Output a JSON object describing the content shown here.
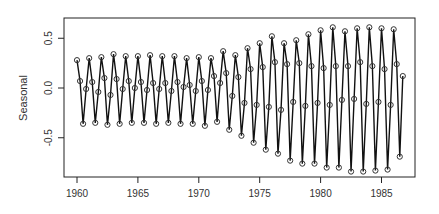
{
  "chart_data": {
    "type": "line",
    "title": "",
    "xlabel": "",
    "ylabel": "Seasonal",
    "xlim": [
      1958.9,
      1987.8
    ],
    "ylim": [
      -0.9,
      0.7
    ],
    "x_ticks": [
      1960,
      1965,
      1970,
      1975,
      1980,
      1985
    ],
    "x_tick_labels": [
      "1960",
      "1965",
      "1970",
      "1975",
      "1980",
      "1985"
    ],
    "y_ticks": [
      -0.5,
      0.0,
      0.5
    ],
    "y_tick_labels": [
      "-0.5",
      "0.0",
      "0.5"
    ],
    "grid": false,
    "legend": null,
    "frequency": 4,
    "start": 1960.0,
    "markers": "open-circle-with-line",
    "series": [
      {
        "name": "Seasonal",
        "values": [
          0.28,
          0.07,
          -0.36,
          -0.01,
          0.3,
          0.06,
          -0.35,
          -0.04,
          0.31,
          0.1,
          -0.37,
          -0.07,
          0.34,
          0.09,
          -0.36,
          -0.01,
          0.32,
          0.07,
          -0.35,
          0.0,
          0.32,
          0.06,
          -0.35,
          -0.02,
          0.33,
          0.05,
          -0.36,
          -0.01,
          0.32,
          0.05,
          -0.35,
          -0.03,
          0.32,
          0.06,
          -0.36,
          0.01,
          0.3,
          0.03,
          -0.36,
          -0.03,
          0.31,
          0.07,
          -0.38,
          -0.02,
          0.3,
          0.12,
          -0.34,
          0.05,
          0.37,
          0.15,
          -0.42,
          -0.08,
          0.33,
          0.11,
          -0.48,
          -0.15,
          0.4,
          0.19,
          -0.55,
          -0.17,
          0.45,
          0.21,
          -0.62,
          -0.19,
          0.52,
          0.26,
          -0.66,
          -0.22,
          0.45,
          0.24,
          -0.73,
          -0.14,
          0.48,
          0.25,
          -0.76,
          -0.18,
          0.54,
          0.22,
          -0.76,
          -0.15,
          0.58,
          0.2,
          -0.8,
          -0.17,
          0.61,
          0.22,
          -0.8,
          -0.12,
          0.57,
          0.22,
          -0.84,
          -0.11,
          0.6,
          0.26,
          -0.84,
          -0.16,
          0.61,
          0.22,
          -0.83,
          -0.14,
          0.6,
          0.19,
          -0.82,
          -0.17,
          0.59,
          0.24,
          -0.69,
          0.12
        ]
      }
    ]
  }
}
